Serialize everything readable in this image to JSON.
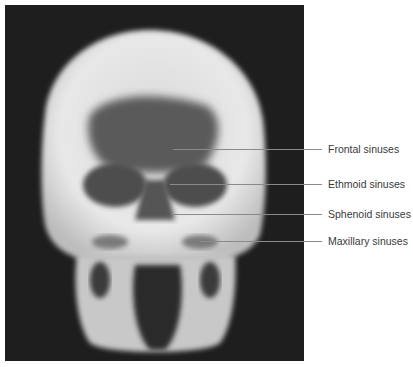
{
  "figure": {
    "labels": [
      {
        "id": "frontal",
        "text": "Frontal sinuses",
        "y": 149,
        "x_start": 173
      },
      {
        "id": "ethmoid",
        "text": "Ethmoid sinuses",
        "y": 184,
        "x_start": 170
      },
      {
        "id": "sphenoid",
        "text": "Sphenoid sinuses",
        "y": 214,
        "x_start": 172
      },
      {
        "id": "maxillary",
        "text": "Maxillary sinuses",
        "y": 241,
        "x_start": 200
      }
    ]
  }
}
